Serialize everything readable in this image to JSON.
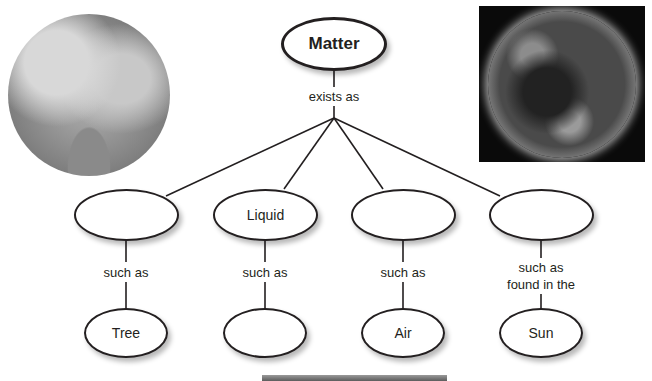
{
  "diagram": {
    "root": {
      "label": "Matter"
    },
    "root_link_label": "exists as",
    "states": [
      {
        "label": "",
        "link_label": "such as",
        "example": "Tree"
      },
      {
        "label": "Liquid",
        "link_label": "such as",
        "example": ""
      },
      {
        "label": "",
        "link_label": "such as",
        "example": "Air"
      },
      {
        "label": "",
        "link_label": "such as\nfound in the",
        "link_label_line1": "such as",
        "link_label_line2": "found in the",
        "example": "Sun"
      }
    ],
    "images": [
      {
        "name": "tree-photo",
        "description": "grayscale photo of a large tree, circular crop"
      },
      {
        "name": "sun-photo",
        "description": "grayscale image of the Sun on black background"
      }
    ]
  }
}
